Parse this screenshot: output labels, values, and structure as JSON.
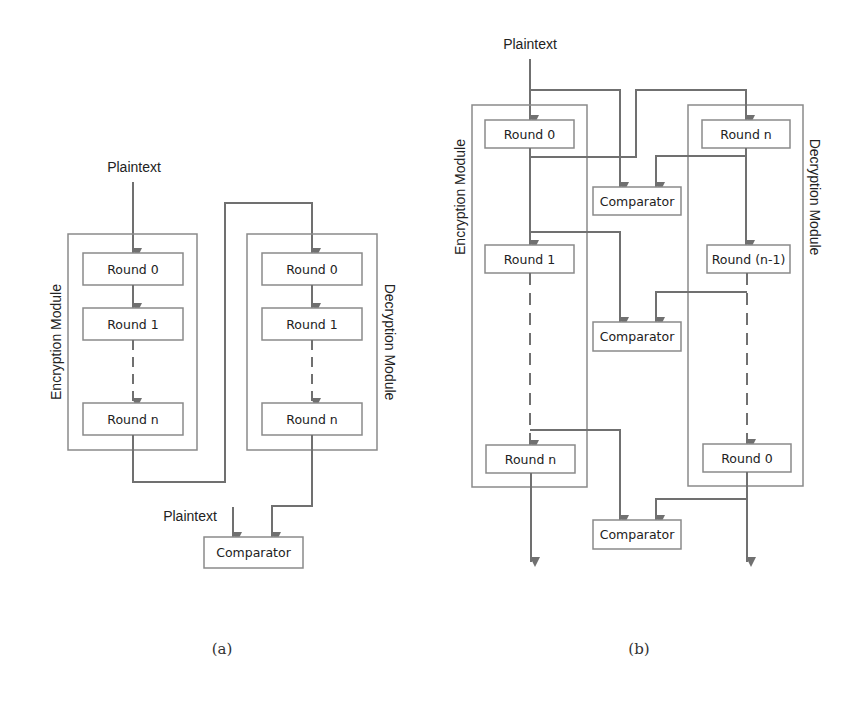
{
  "colors": {
    "line": "#707070",
    "box_border": "#8a8a8a",
    "text": "#222222",
    "background": "#ffffff"
  },
  "diagram_a": {
    "caption": "(a)",
    "input_label": "Plaintext",
    "encryption_module": {
      "label": "Encryption Module",
      "rounds": [
        "Round 0",
        "Round 1",
        "Round n"
      ]
    },
    "decryption_module": {
      "label": "Decryption Module",
      "rounds": [
        "Round 0",
        "Round 1",
        "Round n"
      ]
    },
    "comparator_input_label": "Plaintext",
    "comparator": "Comparator"
  },
  "diagram_b": {
    "caption": "(b)",
    "input_label": "Plaintext",
    "encryption_module": {
      "label": "Encryption Module",
      "rounds": [
        "Round 0",
        "Round 1",
        "Round n"
      ]
    },
    "decryption_module": {
      "label": "Decryption Module",
      "rounds": [
        "Round n",
        "Round (n-1)",
        "Round 0"
      ]
    },
    "comparators": [
      "Comparator",
      "Comparator",
      "Comparator"
    ]
  }
}
